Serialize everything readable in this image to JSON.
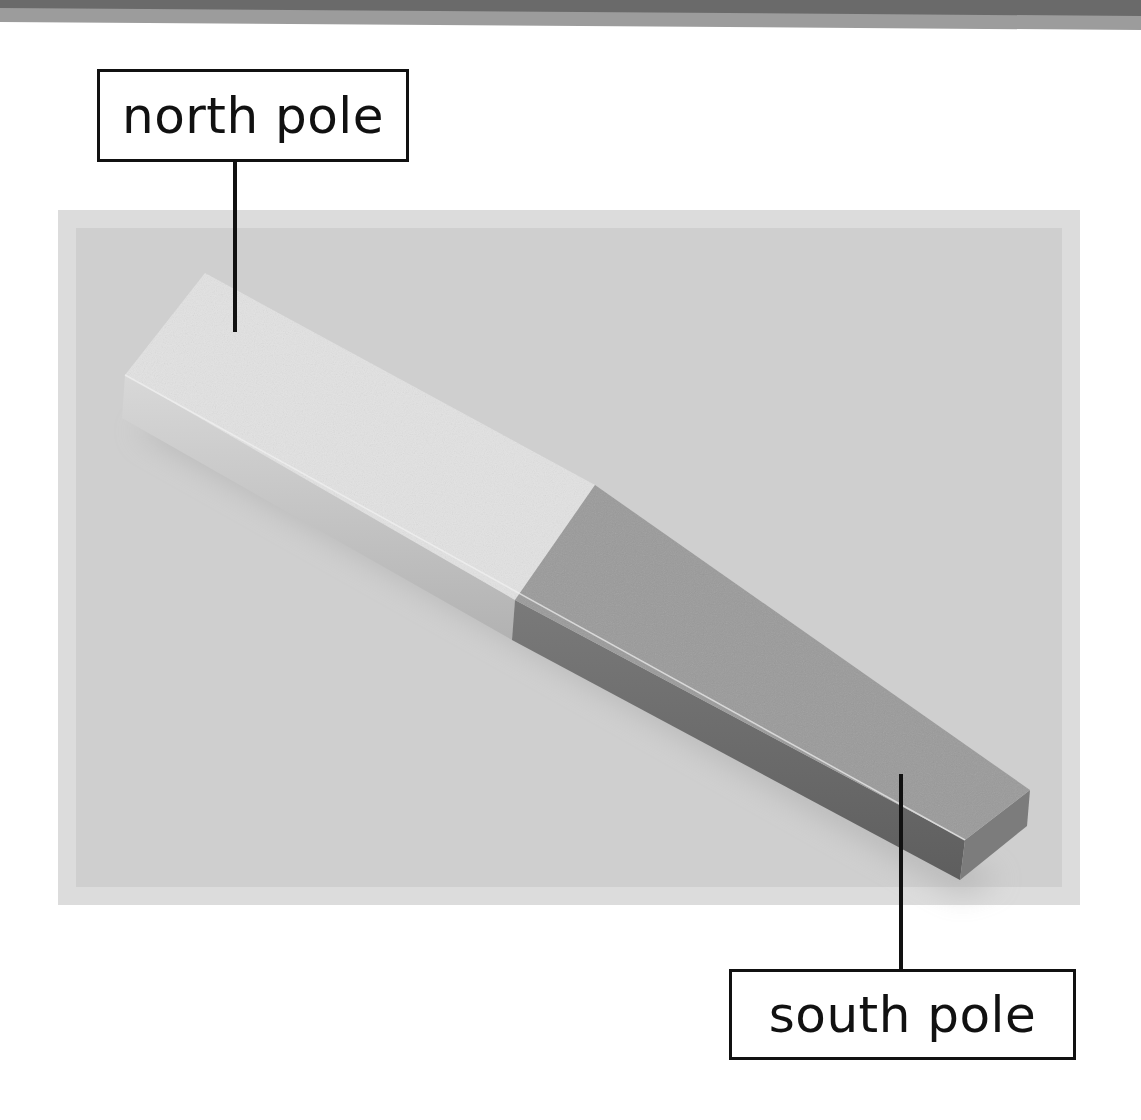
{
  "figure": {
    "labels": {
      "north": "north pole",
      "south": "south pole"
    },
    "colors": {
      "background": "#ffffff",
      "photo_border": "#dcdcdc",
      "photo_background": "#cfcfcf",
      "north_face": "#e2e2e2",
      "north_side": "#c4c4c4",
      "south_face": "#9a9a9a",
      "south_side": "#6e6e6e",
      "label_stroke": "#111111",
      "top_band_dark": "#6a6a6a",
      "top_band_light": "#9c9c9c"
    }
  }
}
